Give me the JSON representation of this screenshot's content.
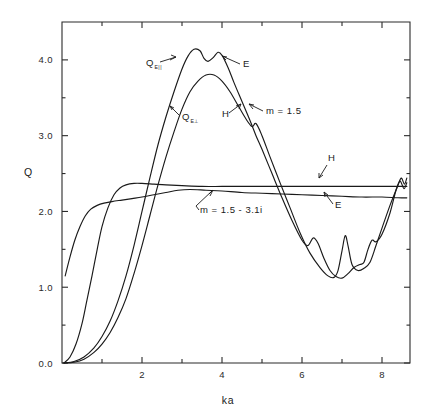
{
  "chart_data": {
    "type": "line",
    "title": "",
    "xlabel": "ka",
    "ylabel": "Q",
    "xlim": [
      0,
      8.7
    ],
    "ylim": [
      0.0,
      4.5
    ],
    "grid": false,
    "legend": "inline-annotations",
    "x_ticks_major": [
      2,
      4,
      6,
      8
    ],
    "x_ticks_minor": [
      1,
      3,
      5,
      7
    ],
    "x_tick_labels": [
      "2",
      "4",
      "6",
      "8"
    ],
    "y_ticks_major": [
      0.0,
      1.0,
      2.0,
      3.0,
      4.0
    ],
    "y_tick_labels": [
      "0.0",
      "1.0",
      "2.0",
      "3.0",
      "4.0"
    ],
    "series": [
      {
        "name": "Q_E-parallel",
        "label": "Q",
        "sublabel": "E||",
        "group": "m = 1.5",
        "polarization": "E",
        "points": [
          [
            0.05,
            0.0
          ],
          [
            0.3,
            0.02
          ],
          [
            0.55,
            0.08
          ],
          [
            0.8,
            0.2
          ],
          [
            1.0,
            0.35
          ],
          [
            1.2,
            0.55
          ],
          [
            1.4,
            0.82
          ],
          [
            1.6,
            1.15
          ],
          [
            1.8,
            1.55
          ],
          [
            2.0,
            2.0
          ],
          [
            2.2,
            2.45
          ],
          [
            2.4,
            2.88
          ],
          [
            2.6,
            3.25
          ],
          [
            2.8,
            3.58
          ],
          [
            3.0,
            3.88
          ],
          [
            3.15,
            4.05
          ],
          [
            3.3,
            4.14
          ],
          [
            3.45,
            4.12
          ],
          [
            3.55,
            4.02
          ],
          [
            3.65,
            3.98
          ],
          [
            3.78,
            4.03
          ],
          [
            3.9,
            4.1
          ],
          [
            4.0,
            4.06
          ],
          [
            4.15,
            3.9
          ],
          [
            4.3,
            3.7
          ],
          [
            4.5,
            3.45
          ],
          [
            4.7,
            3.2
          ],
          [
            4.85,
            3.0
          ],
          [
            5.0,
            2.82
          ],
          [
            5.25,
            2.5
          ],
          [
            5.5,
            2.18
          ],
          [
            5.75,
            1.88
          ],
          [
            6.0,
            1.62
          ],
          [
            6.15,
            1.55
          ],
          [
            6.28,
            1.65
          ],
          [
            6.4,
            1.58
          ],
          [
            6.55,
            1.38
          ],
          [
            6.7,
            1.22
          ],
          [
            6.85,
            1.14
          ],
          [
            7.0,
            1.12
          ],
          [
            7.15,
            1.18
          ],
          [
            7.3,
            1.26
          ],
          [
            7.45,
            1.3
          ],
          [
            7.55,
            1.33
          ],
          [
            7.65,
            1.5
          ],
          [
            7.75,
            1.62
          ],
          [
            7.85,
            1.6
          ],
          [
            8.0,
            1.7
          ],
          [
            8.2,
            1.98
          ],
          [
            8.35,
            2.28
          ],
          [
            8.45,
            2.4
          ],
          [
            8.55,
            2.3
          ],
          [
            8.62,
            2.38
          ]
        ]
      },
      {
        "name": "Q_E-perpendicular",
        "label": "Q",
        "sublabel": "E⊥",
        "group": "m = 1.5",
        "polarization": "H",
        "points": [
          [
            0.05,
            0.0
          ],
          [
            0.3,
            0.01
          ],
          [
            0.55,
            0.05
          ],
          [
            0.8,
            0.14
          ],
          [
            1.0,
            0.25
          ],
          [
            1.2,
            0.4
          ],
          [
            1.4,
            0.6
          ],
          [
            1.6,
            0.85
          ],
          [
            1.8,
            1.18
          ],
          [
            2.0,
            1.55
          ],
          [
            2.2,
            1.95
          ],
          [
            2.4,
            2.35
          ],
          [
            2.6,
            2.72
          ],
          [
            2.8,
            3.05
          ],
          [
            3.0,
            3.35
          ],
          [
            3.2,
            3.58
          ],
          [
            3.4,
            3.72
          ],
          [
            3.6,
            3.8
          ],
          [
            3.8,
            3.8
          ],
          [
            4.0,
            3.72
          ],
          [
            4.2,
            3.58
          ],
          [
            4.4,
            3.4
          ],
          [
            4.6,
            3.22
          ],
          [
            4.75,
            3.12
          ],
          [
            4.85,
            3.16
          ],
          [
            5.0,
            3.0
          ],
          [
            5.2,
            2.72
          ],
          [
            5.45,
            2.38
          ],
          [
            5.7,
            2.05
          ],
          [
            5.95,
            1.72
          ],
          [
            6.2,
            1.45
          ],
          [
            6.45,
            1.26
          ],
          [
            6.65,
            1.15
          ],
          [
            6.8,
            1.13
          ],
          [
            6.9,
            1.22
          ],
          [
            7.0,
            1.48
          ],
          [
            7.08,
            1.68
          ],
          [
            7.15,
            1.55
          ],
          [
            7.25,
            1.3
          ],
          [
            7.4,
            1.22
          ],
          [
            7.55,
            1.25
          ],
          [
            7.7,
            1.33
          ],
          [
            7.85,
            1.55
          ],
          [
            8.0,
            1.78
          ],
          [
            8.2,
            2.08
          ],
          [
            8.38,
            2.32
          ],
          [
            8.48,
            2.44
          ],
          [
            8.56,
            2.36
          ],
          [
            8.62,
            2.44
          ]
        ]
      },
      {
        "name": "absorbing-H",
        "label": "H",
        "group": "m = 1.5 - 3.1i",
        "polarization": "H",
        "points": [
          [
            0.05,
            0.0
          ],
          [
            0.2,
            0.08
          ],
          [
            0.35,
            0.25
          ],
          [
            0.5,
            0.52
          ],
          [
            0.62,
            0.82
          ],
          [
            0.75,
            1.15
          ],
          [
            0.88,
            1.5
          ],
          [
            1.0,
            1.8
          ],
          [
            1.15,
            2.05
          ],
          [
            1.3,
            2.22
          ],
          [
            1.45,
            2.31
          ],
          [
            1.6,
            2.35
          ],
          [
            1.8,
            2.37
          ],
          [
            2.0,
            2.37
          ],
          [
            2.3,
            2.36
          ],
          [
            2.6,
            2.35
          ],
          [
            3.0,
            2.34
          ],
          [
            3.5,
            2.33
          ],
          [
            4.0,
            2.33
          ],
          [
            4.5,
            2.33
          ],
          [
            5.0,
            2.33
          ],
          [
            5.5,
            2.33
          ],
          [
            6.0,
            2.33
          ],
          [
            6.5,
            2.33
          ],
          [
            7.0,
            2.33
          ],
          [
            7.5,
            2.33
          ],
          [
            8.0,
            2.33
          ],
          [
            8.4,
            2.33
          ],
          [
            8.62,
            2.33
          ]
        ]
      },
      {
        "name": "absorbing-E",
        "label": "E",
        "group": "m = 1.5 - 3.1i",
        "polarization": "E",
        "points": [
          [
            0.08,
            1.15
          ],
          [
            0.2,
            1.4
          ],
          [
            0.32,
            1.62
          ],
          [
            0.45,
            1.8
          ],
          [
            0.58,
            1.94
          ],
          [
            0.72,
            2.03
          ],
          [
            0.88,
            2.08
          ],
          [
            1.05,
            2.11
          ],
          [
            1.25,
            2.13
          ],
          [
            1.5,
            2.15
          ],
          [
            1.75,
            2.17
          ],
          [
            2.0,
            2.19
          ],
          [
            2.3,
            2.22
          ],
          [
            2.6,
            2.25
          ],
          [
            2.9,
            2.28
          ],
          [
            3.2,
            2.29
          ],
          [
            3.6,
            2.28
          ],
          [
            4.0,
            2.27
          ],
          [
            4.5,
            2.25
          ],
          [
            5.0,
            2.24
          ],
          [
            5.5,
            2.23
          ],
          [
            6.0,
            2.22
          ],
          [
            6.5,
            2.21
          ],
          [
            7.0,
            2.2
          ],
          [
            7.5,
            2.19
          ],
          [
            8.0,
            2.19
          ],
          [
            8.4,
            2.18
          ],
          [
            8.62,
            2.18
          ]
        ]
      }
    ],
    "annotations": [
      {
        "id": "q-e-parallel",
        "text": "Q",
        "sub": "E||",
        "x_px": 146,
        "y_px": 66
      },
      {
        "id": "q-e-perp",
        "text": "Q",
        "sub": "E⊥",
        "x_px": 182,
        "y_px": 120
      },
      {
        "id": "label-e-peak",
        "text": "E",
        "x_px": 243,
        "y_px": 67
      },
      {
        "id": "label-h-peak",
        "text": "H",
        "x_px": 222,
        "y_px": 117
      },
      {
        "id": "label-m15",
        "text": "m = 1.5",
        "x_px": 266,
        "y_px": 114
      },
      {
        "id": "label-m15-31i",
        "text": "m = 1.5 -  3.1i",
        "x_px": 200,
        "y_px": 213
      },
      {
        "id": "label-h-right",
        "text": "H",
        "x_px": 328,
        "y_px": 161
      },
      {
        "id": "label-e-right",
        "text": "E",
        "x_px": 335,
        "y_px": 208
      }
    ]
  },
  "axes": {
    "y_label": "Q",
    "x_label": "ka",
    "y_tick_labels": [
      "4.0",
      "3.0",
      "2.0",
      "1.0",
      "0.0"
    ],
    "x_tick_labels": [
      "2",
      "4",
      "6",
      "8"
    ]
  },
  "colors": {
    "background": "#ffffff",
    "curve": "#1a1a1a",
    "axis": "#2a2a2a",
    "text": "#1a1a1a"
  }
}
